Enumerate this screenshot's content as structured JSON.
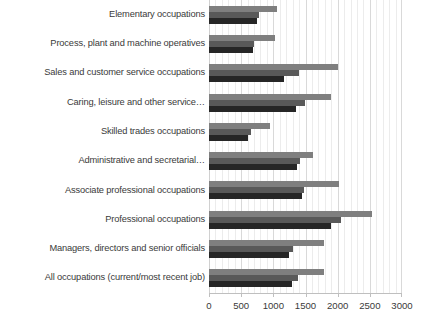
{
  "chart_data": {
    "type": "bar",
    "orientation": "horizontal",
    "title": "",
    "xlabel": "",
    "ylabel": "",
    "xlim": [
      0,
      3000
    ],
    "xticks": [
      0,
      500,
      1000,
      1500,
      2000,
      2500,
      3000
    ],
    "xtick_labels": [
      "0",
      "500",
      "1000",
      "1500",
      "2000",
      "2500",
      "3000"
    ],
    "grid": true,
    "legend": "none",
    "categories": [
      "Elementary occupations",
      "Process, plant and machine operatives",
      "Sales and customer service occupations",
      "Caring, leisure and other service…",
      "Skilled trades occupations",
      "Administrative and secretarial…",
      "Associate professional occupations",
      "Professional occupations",
      "Managers, directors and senior officials",
      "All occupations (current/most recent job)"
    ],
    "series": [
      {
        "name": "series-1",
        "color": "#7f7f7f",
        "values": [
          1060,
          1030,
          2000,
          1900,
          950,
          1620,
          2020,
          2540,
          1780,
          1790
        ]
      },
      {
        "name": "series-2",
        "color": "#595959",
        "values": [
          780,
          700,
          1400,
          1490,
          660,
          1420,
          1480,
          2050,
          1300,
          1390
        ]
      },
      {
        "name": "series-3",
        "color": "#262626",
        "values": [
          745,
          680,
          1160,
          1350,
          600,
          1370,
          1450,
          1900,
          1250,
          1290
        ]
      }
    ]
  }
}
